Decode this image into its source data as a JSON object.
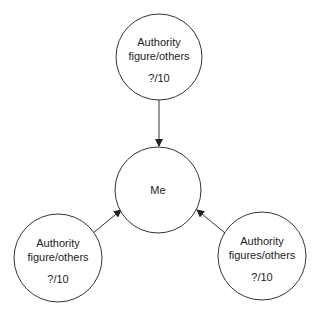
{
  "diagram": {
    "nodes": [
      {
        "id": "top",
        "line1": "Authority",
        "line2": "figure/others",
        "score": "?/10"
      },
      {
        "id": "me",
        "label": "Me"
      },
      {
        "id": "left",
        "line1": "Authority",
        "line2": "figure/others",
        "score": "?/10"
      },
      {
        "id": "right",
        "line1": "Authority",
        "line2": "figures/others",
        "score": "?/10"
      }
    ],
    "edges": [
      {
        "from": "top",
        "to": "me"
      },
      {
        "from": "left",
        "to": "me"
      },
      {
        "from": "right",
        "to": "me"
      }
    ],
    "colors": {
      "stroke": "#333333",
      "text": "#222222",
      "background": "#ffffff"
    }
  }
}
